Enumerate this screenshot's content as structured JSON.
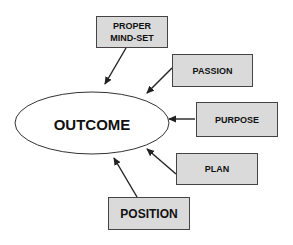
{
  "diagram": {
    "title": "",
    "colors": {
      "box_fill": "#dadada",
      "box_stroke": "#444444",
      "ellipse_fill": "#ffffff",
      "ellipse_stroke": "#333333",
      "arrow": "#222222",
      "text": "#111111"
    },
    "center": {
      "id": "outcome",
      "label": "OUTCOME",
      "shape": "ellipse",
      "cx": 92,
      "cy": 123,
      "rx": 77,
      "ry": 31
    },
    "nodes": [
      {
        "id": "proper-mind-set",
        "label_lines": [
          "PROPER",
          "MIND-SET"
        ],
        "x": 96,
        "y": 16,
        "w": 71,
        "h": 31,
        "font_size": 9
      },
      {
        "id": "passion",
        "label_lines": [
          "PASSION"
        ],
        "x": 172,
        "y": 54,
        "w": 80,
        "h": 32,
        "font_size": 9
      },
      {
        "id": "purpose",
        "label_lines": [
          "PURPOSE"
        ],
        "x": 196,
        "y": 102,
        "w": 81,
        "h": 34,
        "font_size": 9
      },
      {
        "id": "plan",
        "label_lines": [
          "PLAN"
        ],
        "x": 176,
        "y": 153,
        "w": 81,
        "h": 31,
        "font_size": 9
      },
      {
        "id": "position",
        "label_lines": [
          "POSITION"
        ],
        "x": 108,
        "y": 197,
        "w": 81,
        "h": 32,
        "font_size": 12
      }
    ],
    "edges": [
      {
        "from": "proper-mind-set",
        "to": "outcome",
        "x1": 126,
        "y1": 48,
        "x2": 105,
        "y2": 84
      },
      {
        "from": "passion",
        "to": "outcome",
        "x1": 172,
        "y1": 68,
        "x2": 147,
        "y2": 93
      },
      {
        "from": "purpose",
        "to": "outcome",
        "x1": 195,
        "y1": 119,
        "x2": 169,
        "y2": 119
      },
      {
        "from": "plan",
        "to": "outcome",
        "x1": 176,
        "y1": 174,
        "x2": 147,
        "y2": 149
      },
      {
        "from": "position",
        "to": "outcome",
        "x1": 137,
        "y1": 197,
        "x2": 114,
        "y2": 158
      }
    ]
  }
}
